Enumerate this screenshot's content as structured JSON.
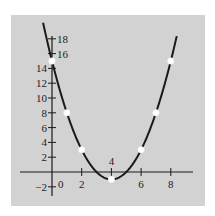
{
  "chart_data": {
    "type": "line",
    "title": "",
    "xlabel": "",
    "ylabel": "",
    "function": "y = (x - 4)^2 - 1",
    "x_ticks": [
      0,
      2,
      4,
      6,
      8
    ],
    "y_ticks": [
      -2,
      2,
      4,
      6,
      8,
      10,
      12,
      14,
      16,
      18
    ],
    "x_tick_labels": [
      "0",
      "2",
      "4",
      "6",
      "8"
    ],
    "y_tick_labels": [
      "-2",
      "2",
      "4",
      "6",
      "8",
      "10",
      "12",
      "14",
      "16",
      "18"
    ],
    "xlim": [
      -1.5,
      9.5
    ],
    "ylim": [
      -3,
      19
    ],
    "grid": false,
    "series": [
      {
        "name": "parabola",
        "x": [
          -0.6,
          0,
          1,
          2,
          3,
          4,
          5,
          6,
          7,
          8,
          8.4
        ],
        "y": [
          20.2,
          15,
          8,
          3,
          0,
          -1,
          0,
          3,
          8,
          15,
          18.4
        ]
      }
    ],
    "marked_points": [
      {
        "x": 0,
        "y": 15
      },
      {
        "x": 1,
        "y": 8
      },
      {
        "x": 2,
        "y": 3
      },
      {
        "x": 4,
        "y": -1
      },
      {
        "x": 6,
        "y": 3
      },
      {
        "x": 7,
        "y": 8
      },
      {
        "x": 8,
        "y": 15
      }
    ],
    "colors": {
      "background": "#d2d2d2",
      "curve": "#1a1a1a",
      "points": "#ffffff"
    }
  }
}
